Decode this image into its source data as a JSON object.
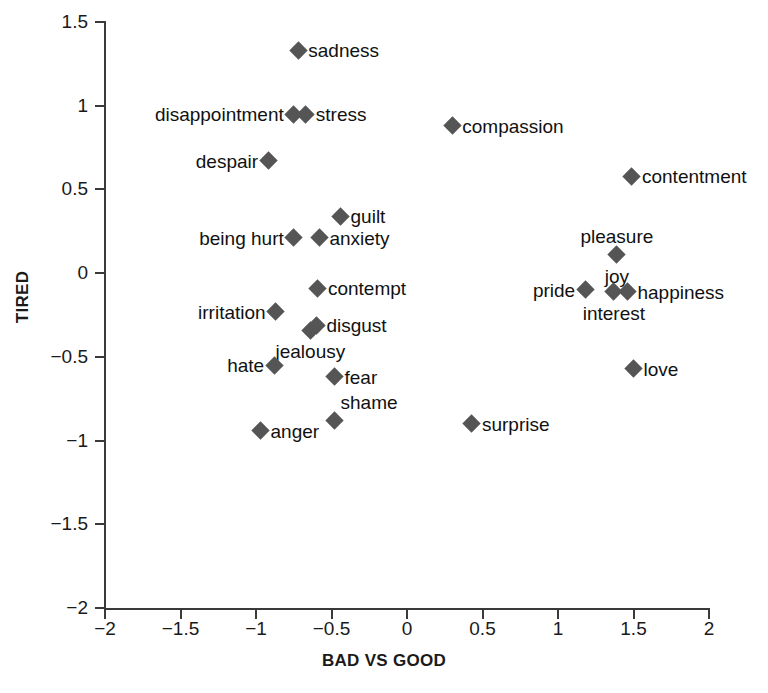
{
  "chart_data": {
    "type": "scatter",
    "title": "",
    "xlabel": "BAD VS GOOD",
    "ylabel": "TIRED",
    "xlim": [
      -2,
      2
    ],
    "ylim": [
      -2,
      1.5
    ],
    "xticks": [
      "-2",
      "-1.5",
      "-1",
      "-0.5",
      "0",
      "0.5",
      "1",
      "1.5",
      "2"
    ],
    "xtick_values": [
      -2,
      -1.5,
      -1,
      -0.5,
      0,
      0.5,
      1,
      1.5,
      2
    ],
    "yticks": [
      "1.5",
      "1",
      "0.5",
      "0",
      "-0.5",
      "-1",
      "-1.5",
      "-2"
    ],
    "ytick_values": [
      1.5,
      1,
      0.5,
      0,
      -0.5,
      -1,
      -1.5,
      -2
    ],
    "grid": false,
    "legend": false,
    "marker": "diamond",
    "marker_color": "#555555",
    "points": [
      {
        "label": "sadness",
        "x": -0.72,
        "y": 1.33,
        "label_pos": "right"
      },
      {
        "label": "disappointment",
        "x": -0.75,
        "y": 0.95,
        "label_pos": "left"
      },
      {
        "label": "stress",
        "x": -0.67,
        "y": 0.95,
        "label_pos": "right"
      },
      {
        "label": "despair",
        "x": -0.92,
        "y": 0.67,
        "label_pos": "left"
      },
      {
        "label": "compassion",
        "x": 0.3,
        "y": 0.88,
        "label_pos": "right"
      },
      {
        "label": "contentment",
        "x": 1.49,
        "y": 0.58,
        "label_pos": "right"
      },
      {
        "label": "guilt",
        "x": -0.44,
        "y": 0.34,
        "label_pos": "right"
      },
      {
        "label": "being hurt",
        "x": -0.75,
        "y": 0.21,
        "label_pos": "left"
      },
      {
        "label": "anxiety",
        "x": -0.58,
        "y": 0.21,
        "label_pos": "right"
      },
      {
        "label": "pleasure",
        "x": 1.39,
        "y": 0.11,
        "label_pos": "above"
      },
      {
        "label": "joy",
        "x": 1.39,
        "y": 0.11,
        "label_pos": "below",
        "hide_marker": true
      },
      {
        "label": "contempt",
        "x": -0.59,
        "y": -0.09,
        "label_pos": "right"
      },
      {
        "label": "pride",
        "x": 1.18,
        "y": -0.1,
        "label_pos": "left"
      },
      {
        "label": "interest",
        "x": 1.37,
        "y": -0.11,
        "label_pos": "below"
      },
      {
        "label": "happiness",
        "x": 1.46,
        "y": -0.11,
        "label_pos": "right"
      },
      {
        "label": "irritation",
        "x": -0.87,
        "y": -0.23,
        "label_pos": "left"
      },
      {
        "label": "disgust",
        "x": -0.6,
        "y": -0.31,
        "label_pos": "right"
      },
      {
        "label": "jealousy",
        "x": -0.64,
        "y": -0.34,
        "label_pos": "below"
      },
      {
        "label": "hate",
        "x": -0.88,
        "y": -0.55,
        "label_pos": "left"
      },
      {
        "label": "love",
        "x": 1.5,
        "y": -0.57,
        "label_pos": "right"
      },
      {
        "label": "fear",
        "x": -0.48,
        "y": -0.62,
        "label_pos": "right"
      },
      {
        "label": "shame",
        "x": -0.48,
        "y": -0.88,
        "label_pos": "above-right"
      },
      {
        "label": "surprise",
        "x": 0.43,
        "y": -0.9,
        "label_pos": "right"
      },
      {
        "label": "anger",
        "x": -0.97,
        "y": -0.94,
        "label_pos": "right"
      }
    ]
  }
}
